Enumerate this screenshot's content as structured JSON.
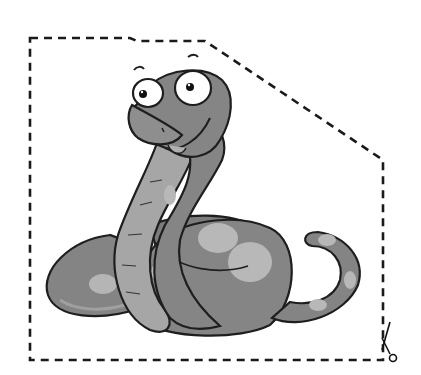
{
  "image": {
    "subject": "cartoon snake cut-out",
    "description": "Grayscale cartoon snake with spotted coiled body inside a dashed cutting outline with scissors icon"
  },
  "colors": {
    "background": "#ffffff",
    "body_dark": "#7a7a7a",
    "body_mid": "#8c8c8c",
    "belly": "#a8a8a8",
    "spots": "#b8b8b8",
    "outline": "#1e1e1e",
    "eye_white": "#ffffff"
  },
  "cut_line": {
    "style": "dashed",
    "points": [
      [
        30,
        38
      ],
      [
        130,
        38
      ],
      [
        137,
        41
      ],
      [
        205,
        41
      ],
      [
        383,
        160
      ],
      [
        383,
        360
      ],
      [
        30,
        360
      ]
    ]
  },
  "icons": {
    "scissors": "scissors-icon"
  }
}
